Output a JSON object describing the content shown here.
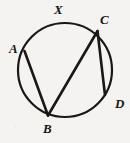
{
  "figure": {
    "background_color": "#f4f3f1",
    "stroke_color": "#1a1816",
    "label_color": "#161412",
    "circle": {
      "cx": 65,
      "cy": 70,
      "r": 47,
      "stroke_width": 2.2
    },
    "points": [
      {
        "id": "A",
        "x": 24.5,
        "y": 51.0
      },
      {
        "id": "B",
        "x": 48.0,
        "y": 115.5
      },
      {
        "id": "C",
        "x": 97.5,
        "y": 31.0
      },
      {
        "id": "D",
        "x": 105.0,
        "y": 95.0
      }
    ],
    "chords": [
      {
        "id": "AB",
        "from": "A",
        "to": "B"
      },
      {
        "id": "BC",
        "from": "B",
        "to": "C"
      },
      {
        "id": "CD",
        "from": "C",
        "to": "D"
      }
    ],
    "labels": [
      {
        "id": "X",
        "text": "X",
        "x": 54,
        "y": 3
      },
      {
        "id": "C",
        "text": "C",
        "x": 100,
        "y": 13
      },
      {
        "id": "A",
        "text": "A",
        "x": 9,
        "y": 42
      },
      {
        "id": "D",
        "text": "D",
        "x": 115,
        "y": 97
      },
      {
        "id": "B",
        "text": "B",
        "x": 43,
        "y": 122
      }
    ]
  }
}
